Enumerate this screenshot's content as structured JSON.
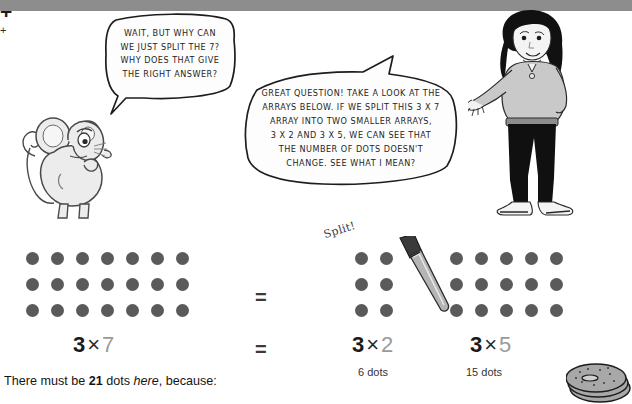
{
  "page": {
    "topbar_color": "#8d8d8d",
    "background": "#ffffff",
    "dot_color": "#5a5a5a"
  },
  "bubbles": {
    "mouse": {
      "speaker": "mouse",
      "lines": [
        "WAIT, BUT WHY CAN",
        "WE JUST SPLIT THE 7?",
        "WHY DOES THAT GIVE",
        "THE RIGHT ANSWER?"
      ]
    },
    "teacher": {
      "speaker": "teacher",
      "lines": [
        "GREAT QUESTION! TAKE A LOOK AT THE",
        "ARRAYS BELOW. IF WE SPLIT THIS 3 X 7",
        "ARRAY INTO TWO SMALLER ARRAYS,",
        "3 X 2 AND 3 X 5, WE CAN SEE THAT",
        "THE NUMBER OF DOTS DOESN'T",
        "CHANGE. SEE WHAT I MEAN?"
      ]
    }
  },
  "annotations": {
    "split_label": "Split!"
  },
  "arrays": [
    {
      "name": "array-3x7",
      "rows": 3,
      "cols": 7,
      "total": 21
    },
    {
      "name": "array-3x2",
      "rows": 3,
      "cols": 2,
      "total": 6
    },
    {
      "name": "array-3x5",
      "rows": 3,
      "cols": 5,
      "total": 15
    }
  ],
  "math": {
    "equals_middle": "=",
    "equals_lower": "=",
    "left_expression": {
      "factor1": "3",
      "operator": "×",
      "factor2": "7"
    },
    "right_expression_a": {
      "factor1": "3",
      "operator": "×",
      "factor2": "2"
    },
    "plus_top": "+",
    "right_expression_b": {
      "factor1": "3",
      "operator": "×",
      "factor2": "5"
    },
    "sub_a": "6 dots",
    "plus_bottom": "+",
    "sub_b": "15 dots"
  },
  "caption": {
    "prefix": "There must be ",
    "count": "21",
    "middle": " dots ",
    "emphasis": "here",
    "suffix": ", because:"
  }
}
